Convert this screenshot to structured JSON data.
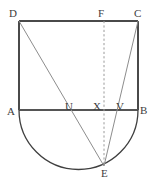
{
  "figure": {
    "type": "geometry-diagram",
    "width": 156,
    "height": 190,
    "background": "#ffffff"
  },
  "colors": {
    "rectangle_stroke": "#4a4a4a",
    "baseline_stroke": "#555555",
    "arc_stroke": "#3f3f3f",
    "cevian_stroke": "#8d8d8d",
    "dashed_stroke": "#9a9a9a",
    "label_color": "#3d3d3d"
  },
  "points": {
    "A": {
      "label": "A",
      "x": 19,
      "y": 110,
      "label_x": 7,
      "label_y": 106
    },
    "B": {
      "label": "B",
      "x": 138,
      "y": 110,
      "label_x": 140,
      "label_y": 105
    },
    "C": {
      "label": "C",
      "x": 138,
      "y": 21,
      "label_x": 134,
      "label_y": 8
    },
    "D": {
      "label": "D",
      "x": 19,
      "y": 21,
      "label_x": 9,
      "label_y": 8
    },
    "E": {
      "label": "E",
      "x": 104,
      "y": 166,
      "label_x": 101,
      "label_y": 168
    },
    "F": {
      "label": "F",
      "x": 104,
      "y": 21,
      "label_x": 98,
      "label_y": 8
    },
    "U": {
      "label": "U",
      "x": 70,
      "y": 110,
      "label_x": 65,
      "label_y": 101
    },
    "V": {
      "label": "V",
      "x": 120,
      "y": 110,
      "label_x": 116,
      "label_y": 101
    },
    "X": {
      "label": "X",
      "x": 104,
      "y": 110,
      "label_x": 93,
      "label_y": 101
    }
  },
  "shapes": {
    "rectangle": {
      "name": "rectangle-ABCD",
      "vertices": "D(19,21) C(138,21) B(138,110) A(19,110)"
    },
    "semicircle": {
      "name": "semicircle-on-AB",
      "center_x": 78.5,
      "center_y": 110,
      "radius": 59.5,
      "direction": "downward",
      "from": "A",
      "to": "B"
    },
    "segments": [
      {
        "name": "segment-DE",
        "from": "D",
        "to": "E",
        "style": "solid",
        "crosses_at": "U"
      },
      {
        "name": "segment-CE",
        "from": "C",
        "to": "E",
        "style": "solid",
        "crosses_at": "V"
      },
      {
        "name": "segment-FE",
        "from": "F",
        "to": "E",
        "style": "dashed",
        "crosses_at": "X"
      },
      {
        "name": "segment-AB",
        "from": "A",
        "to": "B",
        "style": "solid"
      }
    ]
  }
}
